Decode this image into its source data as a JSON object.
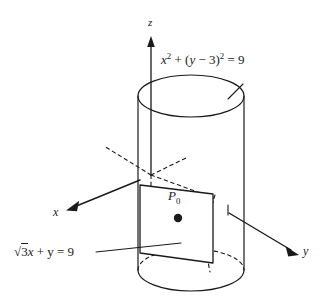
{
  "figure": {
    "background_color": "#ffffff",
    "stroke_color": "#1a1a1a",
    "axes": [
      {
        "name": "x",
        "label": "x",
        "direction": "down-left",
        "style": "solid-with-arrow"
      },
      {
        "name": "y",
        "label": "y",
        "direction": "down-right",
        "style": "solid-with-arrow"
      },
      {
        "name": "z",
        "label": "z",
        "direction": "up",
        "style": "solid-with-arrow"
      }
    ],
    "labels": {
      "cylinder_equation": {
        "lhs_var": "x",
        "exp1": "2",
        "plus": " + (",
        "var2": "y",
        "minus3": " − 3)",
        "exp2": "2",
        "equals": " = 9",
        "plain": "x² + (y − 3)² = 9"
      },
      "plane_equation": {
        "radical": "√",
        "radicand": "3",
        "var_x": "x",
        "rest": " + y = 9",
        "plain": "√3x + y = 9"
      },
      "point": {
        "name": "P",
        "subscript": "0",
        "plain": "P0"
      }
    },
    "top_cropped_text": "g p y y"
  }
}
